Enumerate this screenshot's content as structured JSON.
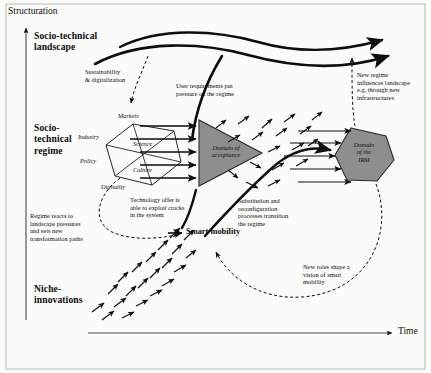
{
  "figure": {
    "type": "diagram",
    "background_color": "#fbfbfa",
    "ink_color": "#0d0d0d",
    "shape_fill": "#8e8e8e"
  },
  "axes": {
    "y_label": "Structuration",
    "x_label": "Time"
  },
  "levels": [
    {
      "id": "landscape",
      "label": "Socio-technical\nlandscape"
    },
    {
      "id": "regime",
      "label": "Socio-\ntechnical\nregime"
    },
    {
      "id": "niche",
      "label": "Niche-\ninnovations"
    }
  ],
  "regime_hexagon": {
    "labels": [
      {
        "id": "markets",
        "text": "Markets"
      },
      {
        "id": "industry",
        "text": "Industry"
      },
      {
        "id": "science",
        "text": "Science"
      },
      {
        "id": "policy",
        "text": "Policy"
      },
      {
        "id": "culture",
        "text": "Culture"
      },
      {
        "id": "digitality",
        "text": "Digitality"
      }
    ]
  },
  "shapes": [
    {
      "id": "domain-of-acceptance",
      "text": "Domain of\nacceptance",
      "form": "triangle"
    },
    {
      "id": "domain-of-the-irm",
      "text": "Domain\nof the\nIRM",
      "form": "hexagon"
    }
  ],
  "annotations": [
    {
      "id": "sustainability",
      "text": "Sustainability\n& digitalization"
    },
    {
      "id": "user-requirements",
      "text": "User requirements put\npressure on the regime"
    },
    {
      "id": "new-regime-influences",
      "text": "New regime\ninfluences landscape\ne.g. through new\ninfrastructures"
    },
    {
      "id": "technology-offer",
      "text": "Technology offer is\nable to exploit cracks\nin the system"
    },
    {
      "id": "regime-reacts",
      "text": "Regime reacts to\nlandscape pressures\nand sets new\ntransformation paths"
    },
    {
      "id": "substitution",
      "text": "Substitution and\nreconfiguration\nprocesses transition\nthe regime"
    },
    {
      "id": "new-roles",
      "text": "New roles shape a\nvision of smart\nmobility"
    }
  ],
  "emergent": {
    "id": "smart-mobility",
    "label": "Smart mobility"
  }
}
